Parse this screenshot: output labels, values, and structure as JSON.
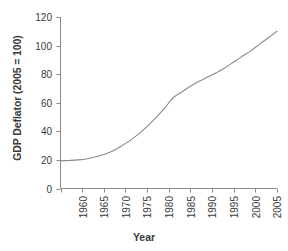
{
  "chart_data": {
    "type": "line",
    "title": "",
    "xlabel": "Year",
    "ylabel": "GDP Deflator (2005 = 100)",
    "xlim": [
      1960,
      2010
    ],
    "ylim": [
      0,
      120
    ],
    "grid": false,
    "legend": null,
    "line_color": "#8a8a8a",
    "axis_color": "#8a8a8a",
    "text_color": "#3a3a3a",
    "background": "#ffffff",
    "xticks": [
      1960,
      1965,
      1970,
      1975,
      1980,
      1985,
      1990,
      1995,
      2000,
      2005,
      2010
    ],
    "xtick_labels": [
      "1960",
      "1965",
      "1970",
      "1975",
      "1980",
      "1985",
      "1990",
      "1995",
      "2000",
      "2005",
      "2010"
    ],
    "yticks": [
      0,
      20,
      40,
      60,
      80,
      100,
      120
    ],
    "ytick_labels": [
      "0",
      "20",
      "40",
      "60",
      "80",
      "100",
      "120"
    ],
    "series": [
      {
        "name": "GDP Deflator",
        "x": [
          1960,
          1962,
          1964,
          1966,
          1968,
          1970,
          1972,
          1974,
          1976,
          1978,
          1980,
          1982,
          1984,
          1986,
          1988,
          1990,
          1992,
          1994,
          1996,
          1998,
          2000,
          2002,
          2004,
          2006,
          2008,
          2010
        ],
        "values": [
          19.3,
          19.6,
          20.0,
          20.7,
          22.0,
          23.8,
          26.2,
          29.6,
          33.5,
          38.0,
          43.5,
          49.5,
          56.0,
          63.5,
          67.5,
          71.5,
          75.0,
          78.0,
          81.0,
          84.5,
          88.5,
          92.5,
          96.5,
          101.0,
          105.5,
          110.0
        ]
      }
    ]
  }
}
